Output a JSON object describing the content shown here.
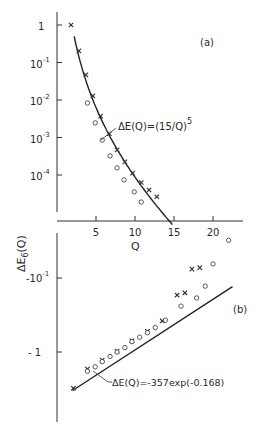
{
  "chart_data": [
    {
      "panel": "(a)",
      "type": "scatter",
      "yscale": "log",
      "xlabel": "Q",
      "ylabel": "ΔE6(Q)",
      "xlim": [
        0,
        24
      ],
      "ylim_log10": [
        -5,
        0.3
      ],
      "x_ticks": [
        5,
        10,
        15,
        20
      ],
      "x_tick_labels": [
        "5",
        "10",
        "15",
        "20"
      ],
      "y_ticks_log10": [
        0,
        -1,
        -2,
        -3,
        -4
      ],
      "y_tick_labels": [
        {
          "base": "1",
          "exp": ""
        },
        {
          "base": "10",
          "exp": "-1"
        },
        {
          "base": "10",
          "exp": "-2"
        },
        {
          "base": "10",
          "exp": "-3"
        },
        {
          "base": "10",
          "exp": "-4"
        }
      ],
      "series": [
        {
          "name": "crosses",
          "marker": "x",
          "x": [
            1.8,
            2.8,
            3.7,
            4.6,
            5.6,
            6.7,
            7.7,
            8.7,
            9.7,
            10.8,
            11.8,
            12.8
          ],
          "log10_y": [
            0.0,
            -0.69,
            -1.33,
            -1.89,
            -2.43,
            -2.9,
            -3.33,
            -3.65,
            -3.95,
            -4.2,
            -4.4,
            -4.58
          ]
        },
        {
          "name": "circles",
          "marker": "o",
          "x": [
            3.9,
            4.9,
            5.8,
            6.8,
            7.7,
            8.6,
            9.9,
            10.8
          ],
          "log10_y": [
            -2.08,
            -2.61,
            -3.07,
            -3.49,
            -3.81,
            -4.13,
            -4.45,
            -4.72
          ]
        }
      ],
      "fit": {
        "label": "ΔE(Q)=(15/Q)",
        "label_exp": "5",
        "formula": "(15/Q)^5 scaled",
        "x_range": [
          2.2,
          14.8
        ]
      },
      "panel_label": "(a)"
    },
    {
      "panel": "(b)",
      "type": "scatter",
      "yscale": "log (negative values)",
      "xlabel": "Q",
      "ylabel": "ΔE6(Q)",
      "y_ticks_log10_abs": [
        -1,
        0
      ],
      "y_tick_labels": [
        {
          "base": "-10",
          "exp": "-1"
        },
        {
          "base": "- 1",
          "exp": ""
        }
      ],
      "series": [
        {
          "name": "crosses",
          "marker": "x",
          "x": [
            2.1,
            3.9,
            5.8,
            7.7,
            9.6,
            11.6,
            13.5,
            15.4,
            16.4,
            17.3,
            18.3
          ],
          "log10_abs_y": [
            0.49,
            0.23,
            0.11,
            -0.01,
            -0.15,
            -0.28,
            -0.42,
            -0.77,
            -0.8,
            -1.12,
            -1.14
          ]
        },
        {
          "name": "circles",
          "marker": "o",
          "x": [
            3.9,
            4.9,
            5.8,
            6.8,
            7.7,
            8.7,
            9.6,
            10.6,
            11.6,
            12.6,
            13.9,
            15.9,
            17.9,
            19.0,
            20.0,
            22.0
          ],
          "log10_abs_y": [
            0.26,
            0.2,
            0.13,
            0.06,
            0.0,
            -0.06,
            -0.14,
            -0.2,
            -0.26,
            -0.33,
            -0.43,
            -0.62,
            -0.73,
            -0.89,
            -1.19,
            -1.51
          ]
        }
      ],
      "fit": {
        "label": "ΔE(Q)=-357exp(-0.16Q)",
        "label_display": "ΔE(Q)=-357exp(-0.168)",
        "x_range": [
          2,
          22.5
        ]
      },
      "panel_label": "(b)"
    }
  ]
}
